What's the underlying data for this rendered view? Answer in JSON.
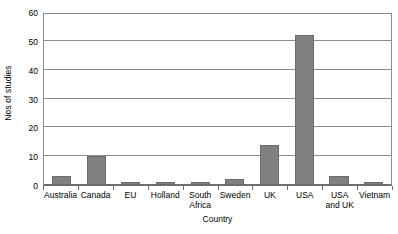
{
  "chart_data": {
    "type": "bar",
    "title": "",
    "xlabel": "Country",
    "ylabel": "Nos of studies",
    "categories": [
      "Australia",
      "Canada",
      "EU",
      "Holland",
      "South Africa",
      "Sweden",
      "UK",
      "USA",
      "USA and UK",
      "Vietnam"
    ],
    "values": [
      3,
      10,
      1,
      1,
      1,
      2,
      14,
      52,
      3,
      1
    ],
    "ylim": [
      0,
      60
    ],
    "ytick_labels": [
      "0",
      "10",
      "20",
      "30",
      "40",
      "50",
      "60"
    ],
    "ytick_values": [
      0,
      10,
      20,
      30,
      40,
      50,
      60
    ],
    "grid": true,
    "legend": false,
    "bar_color": "#808080",
    "grid_color": "#8c8c8c",
    "axis_color": "#6e6e6e"
  }
}
